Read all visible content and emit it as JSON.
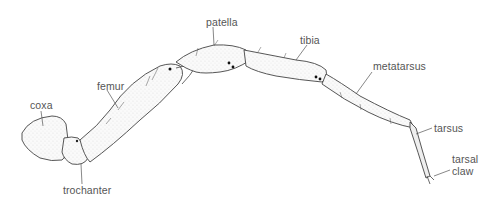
{
  "diagram": {
    "labels": {
      "coxa": "coxa",
      "trochanter": "trochanter",
      "femur": "femur",
      "patella": "patella",
      "tibia": "tibia",
      "metatarsus": "metatarsus",
      "tarsus": "tarsus",
      "tarsal_claw_line1": "tarsal",
      "tarsal_claw_line2": "claw"
    },
    "colors": {
      "ink": "#333333",
      "label": "#555555",
      "fill": "#f4f4f4"
    }
  }
}
